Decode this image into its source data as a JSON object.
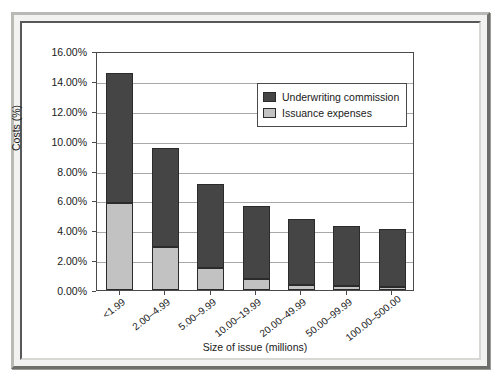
{
  "chart_data": {
    "type": "bar",
    "subtype": "stacked-bar",
    "title": "",
    "xlabel": "Size of issue (millions)",
    "ylabel": "Costs (%)",
    "categories": [
      "<1.99",
      "2.00–4.99",
      "5.00–9.99",
      "10.00–19.99",
      "20.00–49.99",
      "50.00–99.99",
      "100.00–500.00"
    ],
    "series": [
      {
        "name": "Issuance expenses",
        "color": "#c2c2c2",
        "values": [
          5.8,
          2.9,
          1.5,
          0.75,
          0.35,
          0.3,
          0.2
        ]
      },
      {
        "name": "Underwriting commission",
        "color": "#454545",
        "values": [
          8.75,
          6.6,
          5.6,
          4.85,
          4.4,
          4.0,
          3.9
        ]
      }
    ],
    "totals": [
      14.55,
      9.5,
      7.1,
      5.6,
      4.75,
      4.3,
      4.1
    ],
    "ylim": [
      0,
      16
    ],
    "ytick_values": [
      0,
      2,
      4,
      6,
      8,
      10,
      12,
      14,
      16
    ],
    "ytick_labels": [
      "0.00%",
      "2.00%",
      "4.00%",
      "6.00%",
      "8.00%",
      "10.00%",
      "12.00%",
      "14.00%",
      "16.00%"
    ],
    "grid": true,
    "legend_position": "upper right",
    "legend_order": [
      "Underwriting commission",
      "Issuance expenses"
    ]
  },
  "legend": {
    "entries": [
      {
        "label": "Underwriting commission",
        "color": "#454545"
      },
      {
        "label": "Issuance expenses",
        "color": "#c2c2c2"
      }
    ]
  },
  "axes": {
    "y_title": "Costs (%)",
    "x_title": "Size of issue (millions)"
  }
}
